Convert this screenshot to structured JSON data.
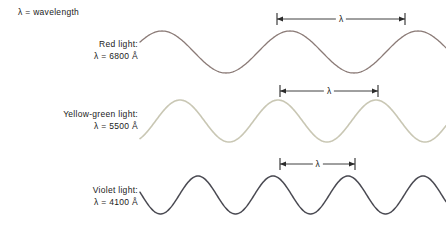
{
  "figure": {
    "width": 446,
    "height": 230,
    "background": "#ffffff",
    "legend_note": "λ = wavelength"
  },
  "rows": [
    {
      "id": "red",
      "label_line1": "Red light:",
      "label_line2": "λ = 6800 Å",
      "wavelength_angstrom": 6800,
      "color": "#8a7a76",
      "lambda_mark": "λ",
      "label_right": 138,
      "label_top": 38,
      "wave": {
        "baseline_y": 52,
        "amplitude": 21,
        "period_px": 128,
        "phase_px": 22,
        "x_start": 140,
        "x_end": 446,
        "stroke_width": 1.3
      },
      "arrow": {
        "x1": 277,
        "x2": 405,
        "y": 19,
        "tick_half": 6
      }
    },
    {
      "id": "yellow-green",
      "label_line1": "Yellow-green light:",
      "label_line2": "λ = 5500 Å",
      "wavelength_angstrom": 5500,
      "color": "#c9c7b4",
      "lambda_mark": "λ",
      "label_right": 138,
      "label_top": 108,
      "wave": {
        "baseline_y": 121,
        "amplitude": 21,
        "period_px": 98,
        "phase_px": 40,
        "x_start": 140,
        "x_end": 446,
        "stroke_width": 1.6
      },
      "arrow": {
        "x1": 280,
        "x2": 378,
        "y": 91,
        "tick_half": 6
      }
    },
    {
      "id": "violet",
      "label_line1": "Violet light:",
      "label_line2": "λ = 4100 Å",
      "wavelength_angstrom": 4100,
      "color": "#4a4a52",
      "lambda_mark": "λ",
      "label_right": 138,
      "label_top": 184,
      "wave": {
        "baseline_y": 195,
        "amplitude": 19,
        "period_px": 75,
        "phase_px": 58,
        "x_start": 140,
        "x_end": 446,
        "stroke_width": 1.5
      },
      "arrow": {
        "x1": 280,
        "x2": 355,
        "y": 164,
        "tick_half": 6
      }
    }
  ]
}
